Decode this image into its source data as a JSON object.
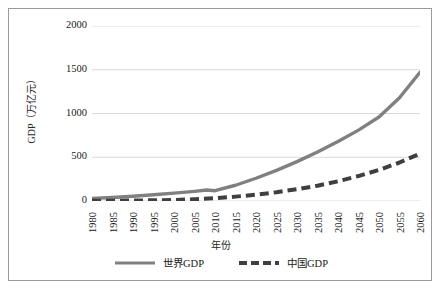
{
  "chart_data": {
    "type": "line",
    "title": "",
    "xlabel": "年份",
    "ylabel": "GDP（万亿元）",
    "xlim": [
      1980,
      2060
    ],
    "ylim": [
      0,
      2000
    ],
    "yticks": [
      0,
      500,
      1000,
      1500,
      2000
    ],
    "ytick_labels": [
      "0",
      "500",
      "1000",
      "1500",
      "2000"
    ],
    "grid": "horizontal",
    "legend_position": "bottom",
    "categories": [
      1980,
      1985,
      1990,
      1995,
      2000,
      2005,
      2010,
      2015,
      2020,
      2025,
      2030,
      2035,
      2040,
      2045,
      2050,
      2055,
      2060
    ],
    "xtick_labels": [
      "1980",
      "1985",
      "1990",
      "1995",
      "2000",
      "2005",
      "2010",
      "2015",
      "2020",
      "2025",
      "2030",
      "2035",
      "2040",
      "2045",
      "2050",
      "2055",
      "2060"
    ],
    "series": [
      {
        "name": "世界GDP",
        "color": "#808080",
        "style": "solid",
        "width": 3.4,
        "x": [
          1980,
          1985,
          1990,
          1995,
          2000,
          2005,
          2008,
          2010,
          2015,
          2020,
          2025,
          2030,
          2035,
          2040,
          2045,
          2050,
          2055,
          2060
        ],
        "values": [
          30,
          40,
          55,
          72,
          90,
          110,
          125,
          118,
          180,
          260,
          350,
          450,
          560,
          680,
          810,
          960,
          1180,
          1470
        ]
      },
      {
        "name": "中国GDP",
        "color": "#3f3f3f",
        "style": "dashed",
        "width": 4.0,
        "x": [
          1980,
          1985,
          1990,
          1995,
          2000,
          2005,
          2010,
          2015,
          2020,
          2025,
          2030,
          2035,
          2040,
          2045,
          2050,
          2055,
          2060
        ],
        "values": [
          2,
          3,
          5,
          8,
          12,
          20,
          32,
          50,
          72,
          100,
          135,
          175,
          225,
          285,
          355,
          440,
          540
        ]
      }
    ]
  },
  "axes": {
    "y_title": "GDP（万亿元）",
    "x_title": "年份"
  },
  "legend": {
    "items": [
      {
        "label": "世界GDP",
        "color": "#808080",
        "style": "solid"
      },
      {
        "label": "中国GDP",
        "color": "#3f3f3f",
        "style": "dashed"
      }
    ]
  },
  "colors": {
    "world_line": "#808080",
    "china_line": "#3f3f3f",
    "gridline": "#d9d9d9",
    "frame": "#9a9a9a",
    "text": "#1a1a1a",
    "background": "#ffffff"
  }
}
